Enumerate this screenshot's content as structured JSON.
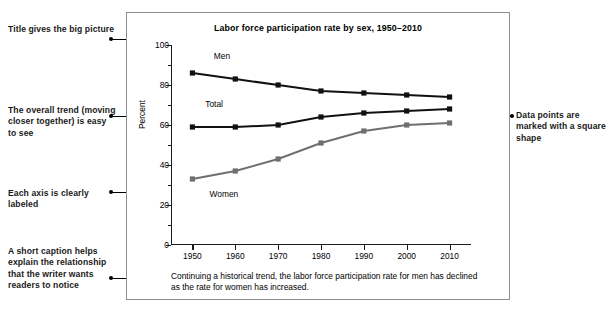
{
  "annotations": {
    "left": [
      {
        "name": "title-callout",
        "text": "Title gives the big picture"
      },
      {
        "name": "trend-callout",
        "text": "The overall trend (moving closer together) is easy to see"
      },
      {
        "name": "axis-callout",
        "text": "Each axis is clearly labeled"
      },
      {
        "name": "caption-callout",
        "text": "A short caption helps explain the relationship that the writer wants readers to notice"
      }
    ],
    "right": [
      {
        "name": "marker-callout",
        "text": "Data points are marked with a square shape"
      }
    ]
  },
  "figure": {
    "caption": "Continuing a historical trend, the labor force participation rate for men has declined as the rate for women has increased."
  },
  "chart_data": {
    "type": "line",
    "title": "Labor force participation rate by sex, 1950–2010",
    "xlabel": "",
    "ylabel": "Percent",
    "x": [
      1950,
      1960,
      1970,
      1980,
      1990,
      2000,
      2010
    ],
    "xtick_labels": [
      "1950",
      "1960",
      "1970",
      "1980",
      "1990",
      "2000",
      "2010"
    ],
    "ytick_labels": [
      "0",
      "20",
      "40",
      "60",
      "80",
      "100"
    ],
    "yticks": [
      0,
      20,
      40,
      60,
      80,
      100
    ],
    "yminor": [
      10,
      30,
      50,
      70,
      90
    ],
    "ylim": [
      0,
      100
    ],
    "xlim": [
      1945,
      2015
    ],
    "grid": false,
    "legend": "inline-labels",
    "marker": "square",
    "series": [
      {
        "name": "Men",
        "values": [
          86,
          83,
          80,
          77,
          76,
          75,
          74
        ],
        "color": "#111111",
        "label_x": 1955,
        "label_y": 94
      },
      {
        "name": "Total",
        "values": [
          59,
          59,
          60,
          64,
          66,
          67,
          68
        ],
        "color": "#111111",
        "label_x": 1953,
        "label_y": 70
      },
      {
        "name": "Women",
        "values": [
          33,
          37,
          43,
          51,
          57,
          60,
          61
        ],
        "color": "#6f6f6f",
        "label_x": 1954,
        "label_y": 25
      }
    ]
  }
}
